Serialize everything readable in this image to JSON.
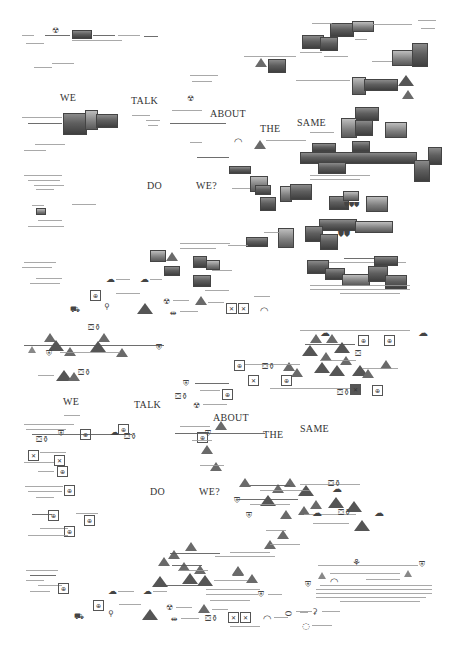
{
  "poster": {
    "upper_section": {
      "headline_words": [
        "WE",
        "TALK",
        "ABOUT",
        "THE",
        "SAME",
        "DO",
        "WE?"
      ]
    },
    "lower_section": {
      "headline_words": [
        "WE",
        "TALK",
        "ABOUT",
        "THE",
        "SAME",
        "DO",
        "WE?"
      ]
    },
    "icons": [
      "triangle-mountain-icon",
      "radiation-trefoil-icon",
      "map-box-icon",
      "figure-icon",
      "cloud-sketch-icon",
      "bottle-icon"
    ],
    "colors": {
      "background": "#ffffff",
      "ink": "#333333",
      "photo": "#5f5f5f"
    }
  }
}
